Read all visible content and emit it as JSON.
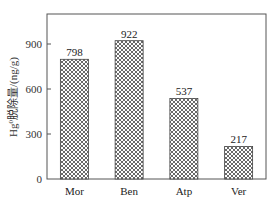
{
  "chart_data": {
    "type": "bar",
    "title": "",
    "xlabel": "",
    "ylabel": "Hg⁰脱除量/(ng/g)",
    "ylabel_parts": {
      "base": "Hg",
      "superscript": "0",
      "rest": "脱除量/(ng/g)"
    },
    "categories": [
      "Mor",
      "Ben",
      "Atp",
      "Ver"
    ],
    "values": [
      798,
      922,
      537,
      217
    ],
    "value_labels": [
      "798",
      "922",
      "537",
      "217"
    ],
    "ylim": [
      0,
      1100
    ],
    "yticks": [
      0,
      300,
      600,
      900
    ],
    "ytick_labels": [
      "0",
      "300",
      "600",
      "900"
    ],
    "grid": false,
    "legend": null,
    "bar_pattern": "crosshatch",
    "colors": {
      "bar_fill": "#ffffff",
      "hatch": "#444444",
      "axis": "#555555"
    }
  }
}
